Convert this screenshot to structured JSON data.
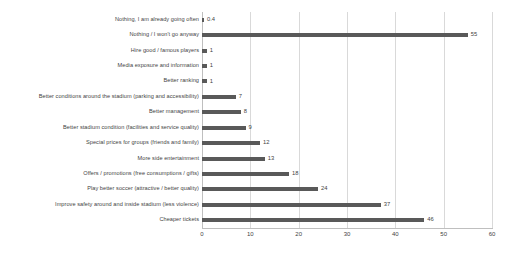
{
  "chart_data": {
    "type": "bar",
    "orientation": "horizontal",
    "title": "",
    "subtitle": "",
    "xlabel": "",
    "ylabel": "",
    "xlim": [
      0,
      60
    ],
    "xticks": [
      0,
      10,
      20,
      30,
      40,
      50,
      60
    ],
    "grid": "vertical",
    "legend": "none",
    "series_color": "#595959",
    "gridline_color": "#d9d9d9",
    "background_color": "#ffffff",
    "text_color": "#3f3f3f",
    "categories": [
      "Nothing, I am already going often",
      "Nothing / I won't  go anyway",
      "Hire good / famous players",
      "Media exposure and information",
      "Better ranking",
      "Better conditions around the stadium (parking and accessibility)",
      "Better management",
      "Better stadium condition (facilities and service quality)",
      "Special prices for groups (friends and family)",
      "More side entertainment",
      "Offers / promotions (free consumptions / gifts)",
      "Play better soccer (attractive / better quality)",
      "Improve safety around and inside stadium (less violence)",
      "Cheaper tickets"
    ],
    "values": [
      0.4,
      55,
      1,
      1,
      1,
      7,
      8,
      9,
      12,
      13,
      18,
      24,
      37,
      46
    ],
    "value_labels": [
      "0.4",
      "55",
      "1",
      "1",
      "1",
      "7",
      "8",
      "9",
      "12",
      "13",
      "18",
      "24",
      "37",
      "46"
    ],
    "xtick_labels": [
      "0",
      "10",
      "20",
      "30",
      "40",
      "50",
      "60"
    ]
  }
}
